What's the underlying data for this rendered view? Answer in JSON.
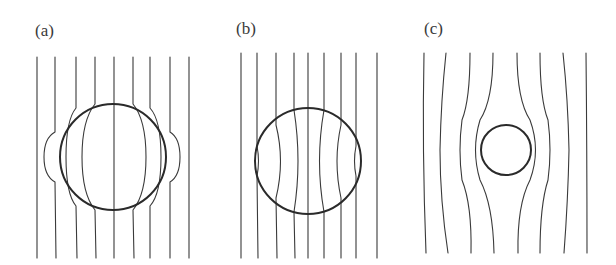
{
  "figure": {
    "panels": [
      {
        "label": "(a)",
        "description": "Uniform field lines converging into a sphere (field lines drawn inward)",
        "field_line_count": 9,
        "circle": {
          "cx": 113,
          "cy": 157,
          "r": 53
        }
      },
      {
        "label": "(b)",
        "description": "Uniform field lines passing through a sphere, spreading inside",
        "field_line_count": 9,
        "circle": {
          "cx": 308,
          "cy": 161,
          "r": 53
        }
      },
      {
        "label": "(c)",
        "description": "Field lines deflected around a small sphere",
        "field_line_count": 8,
        "circle": {
          "cx": 506,
          "cy": 150,
          "r": 25
        }
      }
    ],
    "colors": {
      "line": "#3a3a3a",
      "circle": "#2a2a2a",
      "background": "#ffffff"
    }
  }
}
